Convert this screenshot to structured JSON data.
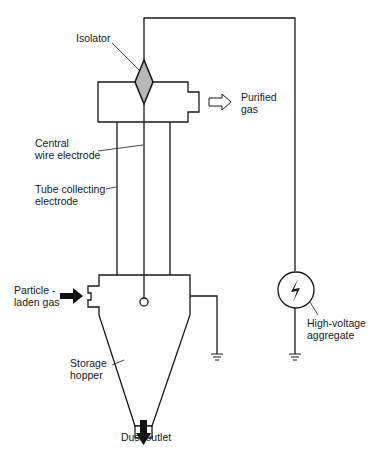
{
  "diagram": {
    "colors": {
      "stroke": "#1a1a1a",
      "isolator_fill": "#b8b8b8",
      "background": "#ffffff"
    },
    "labels": {
      "isolator": "Isolator",
      "purified_gas_1": "Purified",
      "purified_gas_2": "gas",
      "central_wire_1": "Central",
      "central_wire_2": "wire electrode",
      "tube_electrode_1": "Tube collecting",
      "tube_electrode_2": "electrode",
      "particle_gas_1": "Particle -",
      "particle_gas_2": "laden gas",
      "storage_hopper_1": "Storage",
      "storage_hopper_2": "hopper",
      "high_voltage_1": "High-voltage",
      "high_voltage_2": "aggregate",
      "dust_outlet": "Dust outlet"
    },
    "icons": {
      "high_voltage_symbol": "lightning-bolt-in-circle",
      "ground_symbol": "ground-icon",
      "inlet_arrow": "solid-right-arrow",
      "outlet_arrow": "hollow-right-arrow",
      "dust_arrow": "solid-down-arrow"
    }
  }
}
